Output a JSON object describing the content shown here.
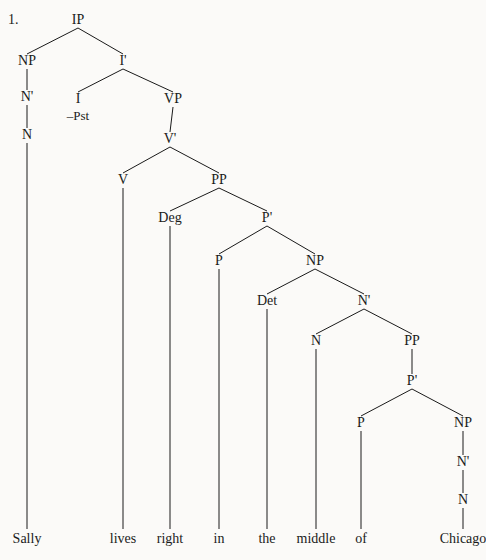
{
  "figure": {
    "item_number": "1.",
    "type": "syntax-tree",
    "sentence": "Sally lives right in the middle of Chicago",
    "ink_color": "#1a1a1a",
    "background_color": "#fbfaf8"
  },
  "nodes": [
    {
      "id": "IP",
      "label": "IP",
      "x": 78,
      "y": 24
    },
    {
      "id": "NP1",
      "label": "NP",
      "x": 27,
      "y": 65
    },
    {
      "id": "Ibar",
      "label": "I'",
      "x": 123,
      "y": 65
    },
    {
      "id": "N1bar",
      "label": "N'",
      "x": 27,
      "y": 101
    },
    {
      "id": "I",
      "label": "I",
      "x": 78,
      "y": 103
    },
    {
      "id": "VP",
      "label": "VP",
      "x": 173,
      "y": 103
    },
    {
      "id": "N1",
      "label": "N",
      "x": 27,
      "y": 139
    },
    {
      "id": "Vbar",
      "label": "V'",
      "x": 170,
      "y": 143
    },
    {
      "id": "V",
      "label": "V",
      "x": 123,
      "y": 184
    },
    {
      "id": "PP1",
      "label": "PP",
      "x": 219,
      "y": 184
    },
    {
      "id": "Deg",
      "label": "Deg",
      "x": 170,
      "y": 222
    },
    {
      "id": "P1bar",
      "label": "P'",
      "x": 267,
      "y": 222
    },
    {
      "id": "P1",
      "label": "P",
      "x": 219,
      "y": 265
    },
    {
      "id": "NP2",
      "label": "NP",
      "x": 315,
      "y": 265
    },
    {
      "id": "Det",
      "label": "Det",
      "x": 267,
      "y": 305
    },
    {
      "id": "N2bar",
      "label": "N'",
      "x": 364,
      "y": 305
    },
    {
      "id": "N2",
      "label": "N",
      "x": 316,
      "y": 345
    },
    {
      "id": "PP2",
      "label": "PP",
      "x": 412,
      "y": 345
    },
    {
      "id": "P2bar",
      "label": "P'",
      "x": 412,
      "y": 385
    },
    {
      "id": "P2",
      "label": "P",
      "x": 361,
      "y": 427
    },
    {
      "id": "NP3",
      "label": "NP",
      "x": 463,
      "y": 427
    },
    {
      "id": "N3bar",
      "label": "N'",
      "x": 463,
      "y": 466
    },
    {
      "id": "N3",
      "label": "N",
      "x": 463,
      "y": 504
    }
  ],
  "features": [
    {
      "id": "Pst",
      "label": "–Pst",
      "parent": "I",
      "x": 78,
      "y": 120
    }
  ],
  "terminals": [
    {
      "id": "t-sally",
      "label": "Sally",
      "x": 27,
      "y": 543,
      "parent": "N1"
    },
    {
      "id": "t-lives",
      "label": "lives",
      "x": 123,
      "y": 543,
      "parent": "V"
    },
    {
      "id": "t-right",
      "label": "right",
      "x": 170,
      "y": 543,
      "parent": "Deg"
    },
    {
      "id": "t-in",
      "label": "in",
      "x": 219,
      "y": 543,
      "parent": "P1"
    },
    {
      "id": "t-the",
      "label": "the",
      "x": 267,
      "y": 543,
      "parent": "Det"
    },
    {
      "id": "t-middle",
      "label": "middle",
      "x": 316,
      "y": 543,
      "parent": "N2"
    },
    {
      "id": "t-of",
      "label": "of",
      "x": 361,
      "y": 543,
      "parent": "P2"
    },
    {
      "id": "t-chicago",
      "label": "Chicago",
      "x": 463,
      "y": 543,
      "parent": "N3"
    }
  ],
  "edges": [
    {
      "from": "IP",
      "to": "NP1"
    },
    {
      "from": "IP",
      "to": "Ibar"
    },
    {
      "from": "NP1",
      "to": "N1bar"
    },
    {
      "from": "N1bar",
      "to": "N1"
    },
    {
      "from": "Ibar",
      "to": "I"
    },
    {
      "from": "Ibar",
      "to": "VP"
    },
    {
      "from": "VP",
      "to": "Vbar"
    },
    {
      "from": "Vbar",
      "to": "V"
    },
    {
      "from": "Vbar",
      "to": "PP1"
    },
    {
      "from": "PP1",
      "to": "Deg"
    },
    {
      "from": "PP1",
      "to": "P1bar"
    },
    {
      "from": "P1bar",
      "to": "P1"
    },
    {
      "from": "P1bar",
      "to": "NP2"
    },
    {
      "from": "NP2",
      "to": "Det"
    },
    {
      "from": "NP2",
      "to": "N2bar"
    },
    {
      "from": "N2bar",
      "to": "N2"
    },
    {
      "from": "N2bar",
      "to": "PP2"
    },
    {
      "from": "PP2",
      "to": "P2bar"
    },
    {
      "from": "P2bar",
      "to": "P2"
    },
    {
      "from": "P2bar",
      "to": "NP3"
    },
    {
      "from": "NP3",
      "to": "N3bar"
    },
    {
      "from": "N3bar",
      "to": "N3"
    }
  ],
  "terminal_edges": [
    {
      "from": "N1",
      "to": "t-sally"
    },
    {
      "from": "V",
      "to": "t-lives"
    },
    {
      "from": "Deg",
      "to": "t-right"
    },
    {
      "from": "P1",
      "to": "t-in"
    },
    {
      "from": "Det",
      "to": "t-the"
    },
    {
      "from": "N2",
      "to": "t-middle"
    },
    {
      "from": "P2",
      "to": "t-of"
    },
    {
      "from": "N3",
      "to": "t-chicago"
    }
  ],
  "item_number_pos": {
    "x": 8,
    "y": 24
  }
}
